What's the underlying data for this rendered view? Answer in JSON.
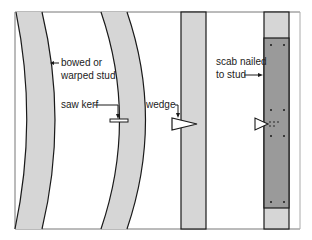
{
  "diagram": {
    "labels": {
      "bowed_line1": "bowed or",
      "bowed_line2": "warped stud",
      "saw_kerf": "saw kerf",
      "wedge": "wedge",
      "scab_line1": "scab nailed",
      "scab_line2": "to stud"
    },
    "colors": {
      "stud_fill": "#d6d6d6",
      "scab_fill": "#9a9a9a",
      "outline": "#1a1a1a",
      "frame": "#777777"
    }
  }
}
